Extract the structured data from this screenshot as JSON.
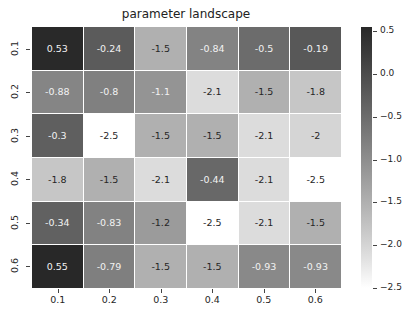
{
  "chart_data": {
    "type": "heatmap",
    "title": "parameter landscape",
    "xlabel": "",
    "ylabel": "",
    "x_tick_labels": [
      "0.1",
      "0.2",
      "0.3",
      "0.4",
      "0.5",
      "0.6"
    ],
    "y_tick_labels": [
      "0.1",
      "0.2",
      "0.3",
      "0.4",
      "0.5",
      "0.6"
    ],
    "values": [
      [
        0.53,
        -0.24,
        -1.5,
        -0.84,
        -0.5,
        -0.19
      ],
      [
        -0.88,
        -0.8,
        -1.1,
        -2.1,
        -1.5,
        -1.8
      ],
      [
        -0.3,
        -2.5,
        -1.5,
        -1.5,
        -2.1,
        -2
      ],
      [
        -1.8,
        -1.5,
        -2.1,
        -0.44,
        -2.1,
        -2.5
      ],
      [
        -0.34,
        -0.83,
        -1.2,
        -2.5,
        -2.1,
        -1.5
      ],
      [
        0.55,
        -0.79,
        -1.5,
        -1.5,
        -0.93,
        -0.93
      ]
    ],
    "annotations": [
      [
        "0.53",
        "-0.24",
        "-1.5",
        "-0.84",
        "-0.5",
        "-0.19"
      ],
      [
        "-0.88",
        "-0.8",
        "-1.1",
        "-2.1",
        "-1.5",
        "-1.8"
      ],
      [
        "-0.3",
        "-2.5",
        "-1.5",
        "-1.5",
        "-2.1",
        "-2"
      ],
      [
        "-1.8",
        "-1.5",
        "-2.1",
        "-0.44",
        "-2.1",
        "-2.5"
      ],
      [
        "-0.34",
        "-0.83",
        "-1.2",
        "-2.5",
        "-2.1",
        "-1.5"
      ],
      [
        "0.55",
        "-0.79",
        "-1.5",
        "-1.5",
        "-0.93",
        "-0.93"
      ]
    ],
    "colormap": "greys",
    "colorbar": {
      "ticks": [
        0.5,
        0.0,
        -0.5,
        -1.0,
        -1.5,
        -2.0,
        -2.5
      ],
      "tick_labels": [
        "0.5",
        "0.0",
        "−0.5",
        "−1.0",
        "−1.5",
        "−2.0",
        "−2.5"
      ],
      "range": [
        -2.5,
        0.55
      ],
      "position": "right"
    },
    "color_low": "#ffffff",
    "color_high": "#2b2b2b",
    "grid": false
  }
}
